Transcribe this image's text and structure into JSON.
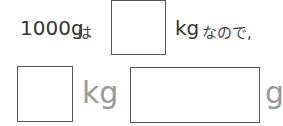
{
  "line1": {
    "prefix": "1000g",
    "particle": "は",
    "unit": "kg",
    "suffix": "なので,"
  },
  "line2": {
    "unit1": "kg",
    "unit2": "g"
  },
  "colors": {
    "text": "#333333",
    "gray_unit": "#999999",
    "box_border": "#555555"
  }
}
